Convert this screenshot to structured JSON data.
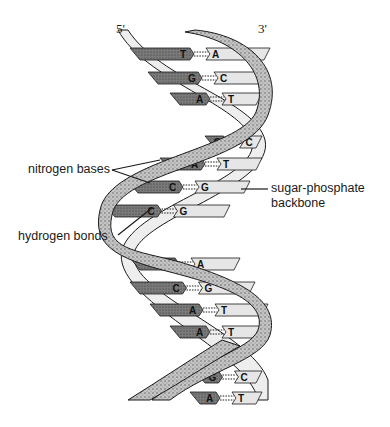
{
  "figure": {
    "strand_ends": {
      "left": "5'",
      "right": "3'"
    },
    "labels": {
      "nitrogen_bases": "nitrogen bases",
      "hydrogen_bonds": "hydrogen bonds",
      "backbone_line1": "sugar-phosphate",
      "backbone_line2": "backbone"
    },
    "base_pairs": [
      {
        "left": "T",
        "right": "A",
        "y": 48
      },
      {
        "left": "G",
        "right": "C",
        "y": 72
      },
      {
        "left": "A",
        "right": "T",
        "y": 93
      },
      {
        "left": "G",
        "right": "C",
        "y": 136
      },
      {
        "left": "A",
        "right": "T",
        "y": 158
      },
      {
        "left": "C",
        "right": "G",
        "y": 181
      },
      {
        "left": "C",
        "right": "G",
        "y": 205
      },
      {
        "left": "T",
        "right": "A",
        "y": 258
      },
      {
        "left": "C",
        "right": "G",
        "y": 282
      },
      {
        "left": "A",
        "right": "T",
        "y": 304
      },
      {
        "left": "A",
        "right": "T",
        "y": 326
      },
      {
        "left": "G",
        "right": "C",
        "y": 371
      },
      {
        "left": "A",
        "right": "T",
        "y": 392
      }
    ],
    "colors": {
      "dark_base": "#6e6e6e",
      "light_base": "#e4e4e4",
      "backbone_stipple": "#b8b8b8",
      "backbone_light": "#efefef",
      "outline": "#1a1a1a"
    }
  }
}
